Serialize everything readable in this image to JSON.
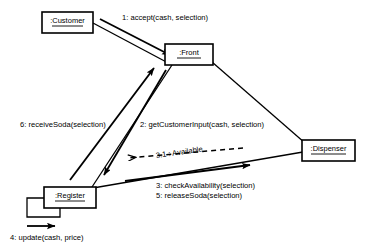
{
  "diagram": {
    "type": "uml-collaboration-diagram",
    "background_color": "#ffffff",
    "line_color": "#000000",
    "objects": [
      {
        "id": "customer",
        "label": ":Customer",
        "x": 42,
        "y": 12,
        "w": 51,
        "h": 21
      },
      {
        "id": "front",
        "label": ":Front",
        "x": 165,
        "y": 44,
        "w": 48,
        "h": 21
      },
      {
        "id": "dispenser",
        "label": ":Dispenser",
        "x": 302,
        "y": 140,
        "w": 53,
        "h": 21
      },
      {
        "id": "register",
        "label": ":Register",
        "x": 44,
        "y": 187,
        "w": 52,
        "h": 21
      }
    ],
    "messages": [
      {
        "id": "m1",
        "label": "1: accept(cash, selection)",
        "from": "customer",
        "to": "front",
        "arrow": "filled",
        "style": "solid",
        "label_x": 122,
        "label_y": 18
      },
      {
        "id": "m2",
        "label": "2: getCustomerInput(cash, selection)",
        "from": "front",
        "to": "register",
        "arrow": "filled",
        "style": "solid",
        "label_x": 140,
        "label_y": 125
      },
      {
        "id": "m3",
        "label": "3: checkAvailability(selection)",
        "from": "register",
        "to": "dispenser",
        "arrow": "filled",
        "style": "solid",
        "label_x": 170,
        "label_y": 185
      },
      {
        "id": "m3_1",
        "label": "3.1 : Available",
        "from": "dispenser",
        "to": "register",
        "arrow": "open",
        "style": "dashed",
        "label_x": 170,
        "label_y": 155
      },
      {
        "id": "m4",
        "label": "4: update(cash, price)",
        "from": "register",
        "to": "register",
        "arrow": "filled",
        "style": "solid",
        "label_x": 10,
        "label_y": 238
      },
      {
        "id": "m5",
        "label": "5: releaseSoda(selection)",
        "from": "register",
        "to": "dispenser",
        "arrow": "filled",
        "style": "solid",
        "label_x": 170,
        "label_y": 195
      },
      {
        "id": "m6",
        "label": "6: receiveSoda(selection)",
        "from": "register",
        "to": "front",
        "arrow": "filled",
        "style": "solid",
        "label_x": 20,
        "label_y": 125
      }
    ],
    "associations": [
      {
        "id": "a1",
        "from": "customer",
        "to": "front"
      },
      {
        "id": "a2",
        "from": "front",
        "to": "dispenser"
      },
      {
        "id": "a3",
        "from": "front",
        "to": "register"
      },
      {
        "id": "a4",
        "from": "register",
        "to": "dispenser"
      }
    ]
  }
}
